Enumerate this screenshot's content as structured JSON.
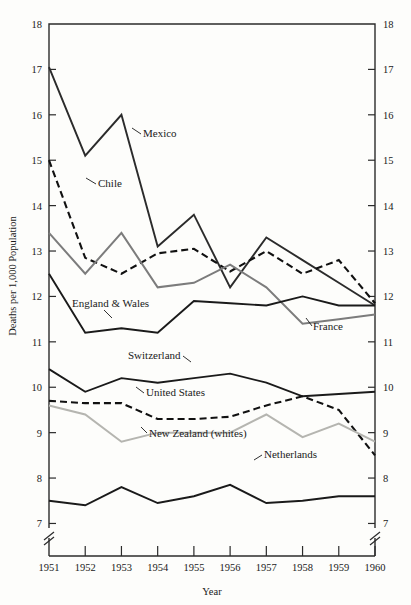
{
  "chart_data": {
    "type": "line",
    "title": "",
    "xlabel": "Year",
    "ylabel": "Deaths per 1,000 Population",
    "x": [
      1951,
      1952,
      1953,
      1954,
      1955,
      1956,
      1957,
      1958,
      1959,
      1960
    ],
    "xtick_labels": [
      "1951",
      "1952",
      "1953",
      "1954",
      "1955",
      "1956",
      "1957",
      "1958",
      "1959",
      "1960"
    ],
    "ytick_labels": [
      "7",
      "8",
      "9",
      "10",
      "11",
      "12",
      "13",
      "14",
      "15",
      "16",
      "17",
      "18"
    ],
    "ylim": [
      6.7,
      18
    ],
    "xlim": [
      1951,
      1960
    ],
    "grid": false,
    "legend_position": "inline-annotations",
    "axis_break": "y-axis broken below 7",
    "right_axis_mirrored": true,
    "series": [
      {
        "name": "Mexico",
        "label": "Mexico",
        "style": "solid",
        "color": "#2b2b2b",
        "width": 1.9,
        "values": [
          17.05,
          15.1,
          16.0,
          13.1,
          13.8,
          12.2,
          13.3,
          12.8,
          12.3,
          11.8
        ]
      },
      {
        "name": "Chile",
        "label": "Chile",
        "style": "dashed",
        "color": "#111111",
        "width": 2.1,
        "values": [
          15.0,
          12.85,
          12.5,
          12.95,
          13.05,
          12.55,
          13.0,
          12.5,
          12.8,
          11.85
        ]
      },
      {
        "name": "France",
        "label": "France",
        "style": "solid",
        "color": "#7c7c7c",
        "width": 2.0,
        "values": [
          13.4,
          12.5,
          13.4,
          12.2,
          12.3,
          12.7,
          12.2,
          11.4,
          11.5,
          11.6
        ]
      },
      {
        "name": "England & Wales",
        "label": "England & Wales",
        "style": "solid",
        "color": "#1a1a1a",
        "width": 1.9,
        "values": [
          12.5,
          11.2,
          11.3,
          11.2,
          11.9,
          11.85,
          11.8,
          12.0,
          11.8,
          11.8
        ]
      },
      {
        "name": "Switzerland",
        "label": "Switzerland",
        "style": "solid",
        "color": "#1a1a1a",
        "width": 1.9,
        "values": [
          10.4,
          9.9,
          10.2,
          10.1,
          10.2,
          10.3,
          10.1,
          9.8,
          9.85,
          9.9
        ]
      },
      {
        "name": "United States",
        "label": "United States",
        "style": "dashed",
        "color": "#111111",
        "width": 2.1,
        "values": [
          9.7,
          9.65,
          9.65,
          9.3,
          9.3,
          9.35,
          9.6,
          9.8,
          9.5,
          8.5
        ]
      },
      {
        "name": "New Zealand (whites)",
        "label": "New Zealand (whites)",
        "style": "solid",
        "color": "#b5b5b0",
        "width": 2.0,
        "values": [
          9.6,
          9.4,
          8.8,
          9.0,
          9.0,
          9.0,
          9.4,
          8.9,
          9.2,
          8.8
        ]
      },
      {
        "name": "Netherlands",
        "label": "Netherlands",
        "style": "solid",
        "color": "#1a1a1a",
        "width": 1.9,
        "values": [
          7.5,
          7.4,
          7.8,
          7.45,
          7.6,
          7.85,
          7.45,
          7.5,
          7.6,
          7.6
        ]
      }
    ],
    "annotations": [
      {
        "name": "mexico",
        "text": "Mexico",
        "x": 143,
        "y": 137
      },
      {
        "name": "chile",
        "text": "Chile",
        "x": 98,
        "y": 187
      },
      {
        "name": "england-wales",
        "text": "England & Wales",
        "x": 72,
        "y": 307
      },
      {
        "name": "france",
        "text": "France",
        "x": 313,
        "y": 330
      },
      {
        "name": "switzerland",
        "text": "Switzerland",
        "x": 128,
        "y": 359
      },
      {
        "name": "united-states",
        "text": "United States",
        "x": 146,
        "y": 396
      },
      {
        "name": "new-zealand",
        "text": "New Zealand (whites)",
        "x": 149,
        "y": 437
      },
      {
        "name": "netherlands",
        "text": "Netherlands",
        "x": 264,
        "y": 458
      }
    ]
  }
}
